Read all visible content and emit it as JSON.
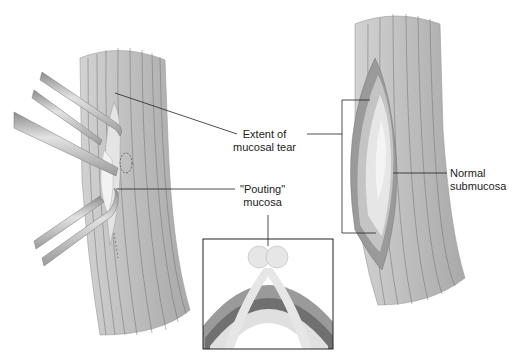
{
  "diagram": {
    "labels": {
      "extent_of_tear": [
        "Extent of",
        "mucosal tear"
      ],
      "pouting_mucosa": [
        "\"Pouting\"",
        "mucosa"
      ],
      "normal_submucosa": [
        "Normal",
        "submucosa"
      ]
    },
    "panels": {
      "left": "esophagus-with-forceps",
      "right": "esophagus-with-exposed-tear",
      "inset": "cross-section-pouting-mucosa"
    },
    "colors": {
      "muscle": "#b0b0b0",
      "muscle_light": "#c8c8c8",
      "fiber_line": "#6e6e6e",
      "mucosa": "#e6e6e6",
      "submucosa": "#dcdcdc",
      "dark_layer": "#707070",
      "mid_layer": "#9a9a9a",
      "forceps": "#a8a8a8",
      "line": "#222222"
    }
  }
}
